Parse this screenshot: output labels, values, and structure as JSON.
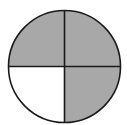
{
  "diagram": {
    "type": "fraction-circle",
    "total_parts": 4,
    "shaded_parts": 3,
    "fraction": "3/4",
    "colors": {
      "shaded": "#a8a8a8",
      "unshaded": "#ffffff",
      "stroke": "#1a1a1a"
    },
    "quadrants": [
      {
        "position": "top-left",
        "shaded": true
      },
      {
        "position": "top-right",
        "shaded": true
      },
      {
        "position": "bottom-right",
        "shaded": true
      },
      {
        "position": "bottom-left",
        "shaded": false
      }
    ]
  }
}
